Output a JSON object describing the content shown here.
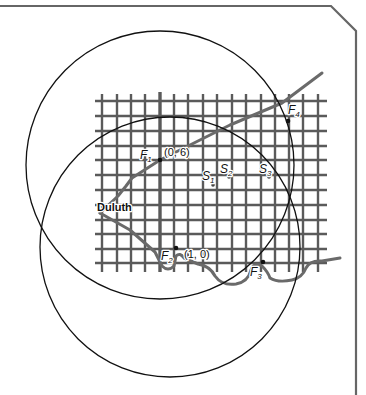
{
  "diagram": {
    "colors": {
      "background": "#ffffff",
      "frame": "#666666",
      "grid": "#5a5a5a",
      "road": "#6a6a6a",
      "shoreline": "#6a6a6a",
      "circle": "#111111",
      "point": "#111111",
      "text": "#111111"
    },
    "city_label": "Duluth",
    "points": [
      {
        "id": "F1",
        "base": "F",
        "sub": "1",
        "coord_label": "(0, 6)",
        "kind": "fire-station"
      },
      {
        "id": "F2",
        "base": "F",
        "sub": "2",
        "coord_label": "(1, 0)",
        "kind": "fire-station"
      },
      {
        "id": "F3",
        "base": "F",
        "sub": "3",
        "coord_label": "",
        "kind": "fire-station"
      },
      {
        "id": "F4",
        "base": "F",
        "sub": "4",
        "coord_label": "",
        "kind": "fire-station"
      },
      {
        "id": "S1",
        "base": "S",
        "sub": "1",
        "coord_label": "",
        "kind": "candidate-site"
      },
      {
        "id": "S2",
        "base": "S",
        "sub": "2",
        "coord_label": "",
        "kind": "candidate-site"
      },
      {
        "id": "S3",
        "base": "S",
        "sub": "3",
        "coord_label": "",
        "kind": "candidate-site"
      }
    ],
    "grid": {
      "vertical_lines": 16,
      "horizontal_lines": 12,
      "thick_axis_column": "F1 column (x = 0)"
    },
    "circles": [
      {
        "name": "upper-circle"
      },
      {
        "name": "lower-circle"
      }
    ]
  }
}
